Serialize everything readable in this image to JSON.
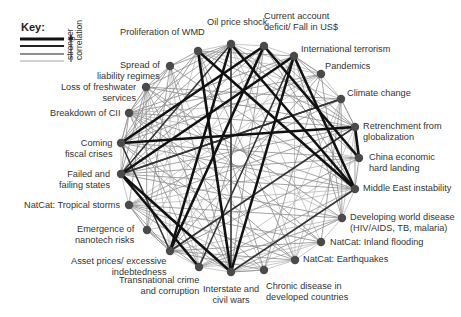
{
  "key": {
    "title": "Key:",
    "caption_line1": "stronger",
    "caption_line2": "correlation",
    "levels": [
      {
        "width": 3.2,
        "color": "#111111"
      },
      {
        "width": 2.2,
        "color": "#222222"
      },
      {
        "width": 1.3,
        "color": "#6a6a6a"
      },
      {
        "width": 0.9,
        "color": "#9a9a9a"
      }
    ]
  },
  "colors": {
    "node": "#4a4a4a",
    "strong": "#111111",
    "medium": "#333333",
    "weak": "#8c8c8c",
    "faint": "#b0b0b0"
  },
  "nodes": [
    {
      "id": "wmd",
      "label": "Proliferation of WMD",
      "x": 198,
      "y": 51,
      "lx": 120,
      "ly": 27,
      "align": "l",
      "lines": [
        "Proliferation of WMD"
      ]
    },
    {
      "id": "oil",
      "label": "Oil price shock",
      "x": 231,
      "y": 44,
      "lx": 207,
      "ly": 17,
      "align": "l",
      "lines": [
        "Oil price shock"
      ]
    },
    {
      "id": "cad",
      "label": "Current account deficit/ Fall in US$",
      "x": 264,
      "y": 46,
      "lx": 264,
      "ly": 11,
      "align": "l",
      "lines": [
        "Current account",
        "deficit/ Fall in US$"
      ]
    },
    {
      "id": "terror",
      "label": "International terrorism",
      "x": 294,
      "y": 56,
      "lx": 301,
      "ly": 44,
      "align": "l",
      "lines": [
        "International terrorism"
      ]
    },
    {
      "id": "pandemics",
      "label": "Pandemics",
      "x": 321,
      "y": 74,
      "lx": 325,
      "ly": 61,
      "align": "l",
      "lines": [
        "Pandemics"
      ]
    },
    {
      "id": "climate",
      "label": "Climate change",
      "x": 341,
      "y": 99,
      "lx": 347,
      "ly": 88,
      "align": "l",
      "lines": [
        "Climate change"
      ]
    },
    {
      "id": "retrench",
      "label": "Retrenchment from globalization",
      "x": 355,
      "y": 127,
      "lx": 363,
      "ly": 121,
      "align": "l",
      "lines": [
        "Retrenchment from",
        "globalization"
      ]
    },
    {
      "id": "china",
      "label": "China economic hard landing",
      "x": 359,
      "y": 158,
      "lx": 369,
      "ly": 152,
      "align": "l",
      "lines": [
        "China economic",
        "hard landing"
      ]
    },
    {
      "id": "mideast",
      "label": "Middle East instability",
      "x": 355,
      "y": 189,
      "lx": 363,
      "ly": 183,
      "align": "l",
      "lines": [
        "Middle East instability"
      ]
    },
    {
      "id": "devworld",
      "label": "Developing world disease (HIV/AIDS, TB, malaria)",
      "x": 342,
      "y": 218,
      "lx": 350,
      "ly": 212,
      "align": "l",
      "lines": [
        "Developing world disease",
        "(HIV/AIDS, TB, malaria)"
      ]
    },
    {
      "id": "flood",
      "label": "NatCat: Inland flooding",
      "x": 321,
      "y": 242,
      "lx": 330,
      "ly": 237,
      "align": "l",
      "lines": [
        "NatCat: Inland flooding"
      ]
    },
    {
      "id": "quake",
      "label": "NatCat: Earthquakes",
      "x": 295,
      "y": 260,
      "lx": 303,
      "ly": 254,
      "align": "l",
      "lines": [
        "NatCat: Earthquakes"
      ]
    },
    {
      "id": "chronic",
      "label": "Chronic disease in developed countries",
      "x": 264,
      "y": 270,
      "lx": 266,
      "ly": 281,
      "align": "l",
      "lines": [
        "Chronic disease in",
        "developed countries"
      ]
    },
    {
      "id": "wars",
      "label": "Interstate and civil wars",
      "x": 231,
      "y": 272,
      "lx": 231,
      "ly": 284,
      "align": "c",
      "lines": [
        "Interstate and",
        "civil wars"
      ]
    },
    {
      "id": "crime",
      "label": "Transnational crime and corruption",
      "x": 199,
      "y": 267,
      "lx": 199,
      "ly": 275,
      "align": "r",
      "lines": [
        "Transnational crime",
        "and corruption"
      ]
    },
    {
      "id": "asset",
      "label": "Asset prices/ excessive indebtedness",
      "x": 170,
      "y": 251,
      "lx": 166,
      "ly": 256,
      "align": "r",
      "lines": [
        "Asset prices/ excessive",
        "indebtedness"
      ]
    },
    {
      "id": "nano",
      "label": "Emergence of nanotech risks",
      "x": 147,
      "y": 230,
      "lx": 134,
      "ly": 224,
      "align": "r",
      "lines": [
        "Emergence of",
        "nanotech risks"
      ]
    },
    {
      "id": "tropical",
      "label": "NatCat: Tropical storms",
      "x": 129,
      "y": 205,
      "lx": 120,
      "ly": 200,
      "align": "r",
      "lines": [
        "NatCat: Tropical storms"
      ]
    },
    {
      "id": "failed",
      "label": "Failed and failing states",
      "x": 121,
      "y": 174,
      "lx": 110,
      "ly": 169,
      "align": "r",
      "lines": [
        "Failed and",
        "failing states"
      ]
    },
    {
      "id": "fiscal",
      "label": "Coming fiscal crises",
      "x": 121,
      "y": 143,
      "lx": 112,
      "ly": 138,
      "align": "r",
      "lines": [
        "Coming",
        "fiscal crises"
      ]
    },
    {
      "id": "cii",
      "label": "Breakdown of CII",
      "x": 129,
      "y": 113,
      "lx": 120,
      "ly": 108,
      "align": "r",
      "lines": [
        "Breakdown of CII"
      ]
    },
    {
      "id": "fresh",
      "label": "Loss of freshwater services",
      "x": 146,
      "y": 87,
      "lx": 136,
      "ly": 82,
      "align": "r",
      "lines": [
        "Loss of freshwater",
        "services"
      ]
    },
    {
      "id": "liability",
      "label": "Spread of liability regimes",
      "x": 170,
      "y": 66,
      "lx": 160,
      "ly": 60,
      "align": "r",
      "lines": [
        "Spread of",
        "liability regimes"
      ]
    }
  ],
  "edges": {
    "strong": [
      [
        "fiscal",
        "retrench"
      ],
      [
        "fiscal",
        "cad"
      ],
      [
        "failed",
        "wars"
      ],
      [
        "failed",
        "crime"
      ],
      [
        "failed",
        "terror"
      ],
      [
        "wmd",
        "mideast"
      ],
      [
        "wmd",
        "wars"
      ],
      [
        "oil",
        "mideast"
      ],
      [
        "oil",
        "asset"
      ],
      [
        "cad",
        "china"
      ],
      [
        "cad",
        "asset"
      ],
      [
        "terror",
        "wars"
      ],
      [
        "retrench",
        "china"
      ],
      [
        "terror",
        "mideast"
      ]
    ],
    "medium": [
      [
        "mideast",
        "wars"
      ],
      [
        "climate",
        "failed"
      ],
      [
        "oil",
        "wars"
      ],
      [
        "failed",
        "climate"
      ],
      [
        "oil",
        "failed"
      ],
      [
        "retrench",
        "asset"
      ],
      [
        "fiscal",
        "asset"
      ],
      [
        "crime",
        "terror"
      ]
    ],
    "weak": [
      [
        "wmd",
        "terror"
      ],
      [
        "wmd",
        "failed"
      ],
      [
        "wmd",
        "fiscal"
      ],
      [
        "wmd",
        "retrench"
      ],
      [
        "wmd",
        "chronic"
      ],
      [
        "wmd",
        "quake"
      ],
      [
        "oil",
        "retrench"
      ],
      [
        "oil",
        "china"
      ],
      [
        "oil",
        "fiscal"
      ],
      [
        "oil",
        "cii"
      ],
      [
        "oil",
        "fresh"
      ],
      [
        "oil",
        "liability"
      ],
      [
        "cad",
        "retrench"
      ],
      [
        "cad",
        "mideast"
      ],
      [
        "cad",
        "failed"
      ],
      [
        "cad",
        "crime"
      ],
      [
        "cad",
        "wars"
      ],
      [
        "terror",
        "fiscal"
      ],
      [
        "terror",
        "cii"
      ],
      [
        "terror",
        "pandemics"
      ],
      [
        "terror",
        "climate"
      ],
      [
        "terror",
        "devworld"
      ],
      [
        "pandemics",
        "devworld"
      ],
      [
        "pandemics",
        "chronic"
      ],
      [
        "pandemics",
        "fiscal"
      ],
      [
        "pandemics",
        "cii"
      ],
      [
        "pandemics",
        "asset"
      ],
      [
        "climate",
        "fresh"
      ],
      [
        "climate",
        "tropical"
      ],
      [
        "climate",
        "flood"
      ],
      [
        "climate",
        "devworld"
      ],
      [
        "climate",
        "retrench"
      ],
      [
        "retrench",
        "failed"
      ],
      [
        "retrench",
        "mideast"
      ],
      [
        "retrench",
        "tropical"
      ],
      [
        "retrench",
        "cii"
      ],
      [
        "china",
        "fiscal"
      ],
      [
        "china",
        "asset"
      ],
      [
        "china",
        "failed"
      ],
      [
        "china",
        "mideast"
      ],
      [
        "mideast",
        "failed"
      ],
      [
        "mideast",
        "fiscal"
      ],
      [
        "mideast",
        "crime"
      ],
      [
        "mideast",
        "cii"
      ],
      [
        "devworld",
        "failed"
      ],
      [
        "devworld",
        "wars"
      ],
      [
        "devworld",
        "crime"
      ],
      [
        "devworld",
        "tropical"
      ],
      [
        "flood",
        "fresh"
      ],
      [
        "flood",
        "tropical"
      ],
      [
        "flood",
        "asset"
      ],
      [
        "flood",
        "cii"
      ],
      [
        "quake",
        "asset"
      ],
      [
        "quake",
        "tropical"
      ],
      [
        "quake",
        "cii"
      ],
      [
        "quake",
        "fiscal"
      ],
      [
        "chronic",
        "fiscal"
      ],
      [
        "chronic",
        "asset"
      ],
      [
        "chronic",
        "wars"
      ],
      [
        "wars",
        "fresh"
      ],
      [
        "wars",
        "tropical"
      ],
      [
        "wars",
        "liability"
      ],
      [
        "crime",
        "cii"
      ],
      [
        "crime",
        "nano"
      ],
      [
        "asset",
        "nano"
      ],
      [
        "asset",
        "tropical"
      ],
      [
        "nano",
        "liability"
      ],
      [
        "nano",
        "fresh"
      ],
      [
        "nano",
        "tropical"
      ],
      [
        "tropical",
        "fresh"
      ],
      [
        "failed",
        "fresh"
      ],
      [
        "failed",
        "cii"
      ],
      [
        "fiscal",
        "cii"
      ],
      [
        "cii",
        "fresh"
      ],
      [
        "cii",
        "liability"
      ],
      [
        "fresh",
        "liability"
      ],
      [
        "liability",
        "wmd"
      ],
      [
        "liability",
        "fiscal"
      ],
      [
        "liability",
        "mideast"
      ],
      [
        "fresh",
        "devworld"
      ],
      [
        "fresh",
        "retrench"
      ]
    ],
    "faint": [
      [
        "wmd",
        "oil"
      ],
      [
        "oil",
        "cad"
      ],
      [
        "cad",
        "terror"
      ],
      [
        "terror",
        "pandemics"
      ],
      [
        "pandemics",
        "climate"
      ],
      [
        "climate",
        "retrench"
      ],
      [
        "mideast",
        "devworld"
      ],
      [
        "devworld",
        "flood"
      ],
      [
        "flood",
        "quake"
      ],
      [
        "quake",
        "chronic"
      ],
      [
        "chronic",
        "wars"
      ],
      [
        "wars",
        "crime"
      ],
      [
        "crime",
        "asset"
      ],
      [
        "asset",
        "nano"
      ],
      [
        "nano",
        "tropical"
      ],
      [
        "tropical",
        "failed"
      ],
      [
        "failed",
        "fiscal"
      ],
      [
        "fiscal",
        "cii"
      ],
      [
        "cii",
        "fresh"
      ],
      [
        "wmd",
        "pandemics"
      ],
      [
        "wmd",
        "climate"
      ],
      [
        "wmd",
        "nano"
      ],
      [
        "oil",
        "pandemics"
      ],
      [
        "oil",
        "quake"
      ],
      [
        "oil",
        "flood"
      ],
      [
        "cad",
        "fiscal"
      ],
      [
        "cad",
        "nano"
      ],
      [
        "terror",
        "asset"
      ],
      [
        "terror",
        "quake"
      ],
      [
        "pandemics",
        "tropical"
      ],
      [
        "pandemics",
        "failed"
      ],
      [
        "climate",
        "cii"
      ],
      [
        "climate",
        "quake"
      ],
      [
        "climate",
        "chronic"
      ],
      [
        "retrench",
        "devworld"
      ],
      [
        "retrench",
        "quake"
      ],
      [
        "china",
        "tropical"
      ],
      [
        "china",
        "cii"
      ],
      [
        "china",
        "crime"
      ],
      [
        "mideast",
        "tropical"
      ],
      [
        "mideast",
        "nano"
      ],
      [
        "devworld",
        "cii"
      ],
      [
        "devworld",
        "asset"
      ],
      [
        "flood",
        "crime"
      ],
      [
        "flood",
        "wars"
      ],
      [
        "quake",
        "crime"
      ],
      [
        "quake",
        "wars"
      ],
      [
        "chronic",
        "tropical"
      ],
      [
        "chronic",
        "liability"
      ],
      [
        "wars",
        "nano"
      ],
      [
        "wars",
        "cii"
      ],
      [
        "crime",
        "liability"
      ],
      [
        "crime",
        "fresh"
      ],
      [
        "asset",
        "liability"
      ],
      [
        "asset",
        "fresh"
      ]
    ]
  }
}
